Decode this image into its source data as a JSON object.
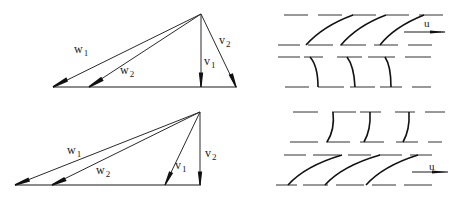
{
  "diagram": {
    "type": "velocity-triangles-and-blade-rows",
    "colors": {
      "line": "#1a1a1a",
      "background": "#ffffff"
    },
    "triangles": [
      {
        "id": "top",
        "apex": [
          201,
          14
        ],
        "base_y": 87,
        "vectors": [
          {
            "name": "w",
            "sub": "1",
            "tip": [
              53,
              87
            ],
            "label_pos": [
              70,
              53
            ]
          },
          {
            "name": "w",
            "sub": "2",
            "tip": [
              89,
              87
            ],
            "label_pos": [
              119,
              67
            ]
          },
          {
            "name": "v",
            "sub": "1",
            "tip": [
              201,
              87
            ],
            "label_pos": [
              204,
              55
            ]
          },
          {
            "name": "v",
            "sub": "2",
            "tip": [
              236,
              87
            ],
            "label_pos": [
              218,
              35
            ]
          }
        ]
      },
      {
        "id": "bottom",
        "apex": [
          200,
          112
        ],
        "base_y": 185,
        "vectors": [
          {
            "name": "w",
            "sub": "1",
            "tip": [
              15,
              185
            ],
            "label_pos": [
              66,
              143
            ]
          },
          {
            "name": "w",
            "sub": "2",
            "tip": [
              52,
              185
            ],
            "label_pos": [
              95,
              164
            ]
          },
          {
            "name": "v",
            "sub": "1",
            "tip": [
              165,
              185
            ],
            "label_pos": [
              175,
              158
            ]
          },
          {
            "name": "v",
            "sub": "2",
            "tip": [
              200,
              185
            ],
            "label_pos": [
              204,
              147
            ]
          }
        ]
      }
    ],
    "labels": {
      "top_w1": "w",
      "top_w1_sub": "1",
      "top_w2": "w",
      "top_w2_sub": "2",
      "top_v1": "v",
      "top_v1_sub": "1",
      "top_v2": "v",
      "top_v2_sub": "2",
      "bot_w1": "w",
      "bot_w1_sub": "1",
      "bot_w2": "w",
      "bot_w2_sub": "2",
      "bot_v1": "v",
      "bot_v1_sub": "1",
      "bot_v2": "v",
      "bot_v2_sub": "2",
      "u_top": "u",
      "u_bottom": "u"
    },
    "blade_rows": [
      {
        "id": "top-rotor",
        "blade_count": 3,
        "shape": "curved-inclined",
        "moving": true,
        "velocity_label": "u"
      },
      {
        "id": "top-stator",
        "blade_count": 3,
        "shape": "curved-near-vertical",
        "moving": false
      },
      {
        "id": "bottom-stator",
        "blade_count": 3,
        "shape": "curved-near-vertical",
        "moving": false
      },
      {
        "id": "bottom-rotor",
        "blade_count": 3,
        "shape": "straight-inclined",
        "moving": true,
        "velocity_label": "u"
      }
    ]
  }
}
